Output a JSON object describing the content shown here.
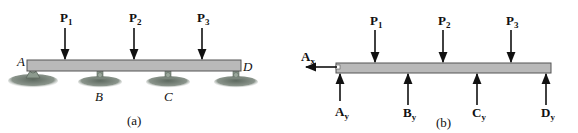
{
  "figure_a": {
    "caption": "(a)",
    "loads": [
      {
        "label": "P",
        "sub": "1"
      },
      {
        "label": "P",
        "sub": "2"
      },
      {
        "label": "P",
        "sub": "3"
      }
    ],
    "points": [
      {
        "label": "A",
        "support": "pin"
      },
      {
        "label": "B",
        "support": "rocker"
      },
      {
        "label": "C",
        "support": "rocker"
      },
      {
        "label": "D",
        "support": "rocker"
      }
    ]
  },
  "figure_b": {
    "caption": "(b)",
    "loads": [
      {
        "label": "P",
        "sub": "1"
      },
      {
        "label": "P",
        "sub": "2"
      },
      {
        "label": "P",
        "sub": "3"
      }
    ],
    "horizontal_reaction": {
      "label": "A",
      "sub": "x"
    },
    "reactions": [
      {
        "label": "A",
        "sub": "y"
      },
      {
        "label": "B",
        "sub": "y"
      },
      {
        "label": "C",
        "sub": "y"
      },
      {
        "label": "D",
        "sub": "y"
      }
    ]
  },
  "colors": {
    "beam_fill": "#b9b9b9",
    "beam_stroke": "#555555",
    "ground": "#6f7a70",
    "arrow": "#111111"
  }
}
